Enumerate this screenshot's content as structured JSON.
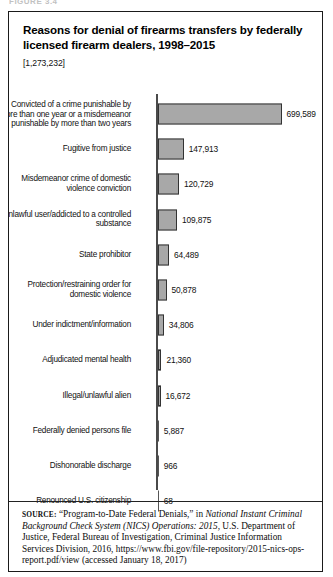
{
  "figure_caption_partial": "FIGURE 3.4",
  "panel": {
    "title": "Reasons for denial of firearms transfers by federally licensed firearm dealers, 1998–2015",
    "total_count": "[1,273,232]"
  },
  "chart_data": {
    "type": "bar",
    "orientation": "horizontal",
    "title": "Reasons for denial of firearms transfers by federally licensed firearm dealers, 1998–2015",
    "subtitle": "[1,273,232]",
    "xlabel": "",
    "ylabel": "",
    "grid": false,
    "legend": "none",
    "axis_range": [
      0,
      750000
    ],
    "categories": [
      "Convicted of a crime punishable by more than one year or a misdemeanor punishable by more than two years",
      "Fugitive from justice",
      "Misdemeanor crime of domestic violence conviction",
      "Unlawful user/addicted to a controlled substance",
      "State prohibitor",
      "Protection/restraining order for domestic violence",
      "Under indictment/information",
      "Adjudicated mental health",
      "Illegal/unlawful alien",
      "Federally denied persons file",
      "Dishonorable discharge",
      "Renounced U.S. citizenship"
    ],
    "values": [
      699589,
      147913,
      120729,
      109875,
      64489,
      50878,
      34806,
      21360,
      16672,
      5887,
      966,
      68
    ],
    "value_labels": [
      "699,589",
      "147,913",
      "120,729",
      "109,875",
      "64,489",
      "50,878",
      "34,806",
      "21,360",
      "16,672",
      "5,887",
      "966",
      "68"
    ],
    "bar_color": "#a8a8a8",
    "bar_border_color": "#333333"
  },
  "source": {
    "label": "SOURCE:",
    "text_part_1": " “Program-to-Date Federal Denials,” in ",
    "italic_1": "National Instant Criminal Background Check System (NICS) Operations: 2015",
    "text_part_2": ", U.S. Department of Justice, Federal Bureau of Investigation, Criminal Justice Information Services Division, 2016, https://www.fbi.gov/file-repository/2015-nics-ops-report.pdf/view (accessed January 18, 2017)"
  }
}
